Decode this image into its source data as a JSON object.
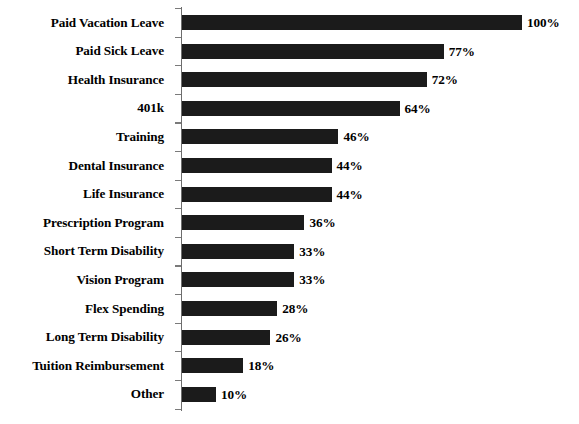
{
  "chart_data": {
    "type": "bar",
    "orientation": "horizontal",
    "title": "",
    "subtitle": "",
    "xlabel": "",
    "ylabel": "",
    "xlim": [
      0,
      100
    ],
    "grid": false,
    "legend": false,
    "value_suffix": "%",
    "bar_color": "#1b1b1b",
    "axis_color": "#6d6d6d",
    "background_color": "#ffffff",
    "categories": [
      "Paid Vacation Leave",
      "Paid Sick Leave",
      "Health Insurance",
      "401k",
      "Training",
      "Dental Insurance",
      "Life Insurance",
      "Prescription Program",
      "Short Term Disability",
      "Vision Program",
      "Flex Spending",
      "Long Term Disability",
      "Tuition Reimbursement",
      "Other"
    ],
    "values": [
      100,
      77,
      72,
      64,
      46,
      44,
      44,
      36,
      33,
      33,
      28,
      26,
      18,
      10
    ],
    "value_labels": [
      "100%",
      "77%",
      "72%",
      "64%",
      "46%",
      "44%",
      "44%",
      "36%",
      "33%",
      "33%",
      "28%",
      "26%",
      "18%",
      "10%"
    ]
  }
}
